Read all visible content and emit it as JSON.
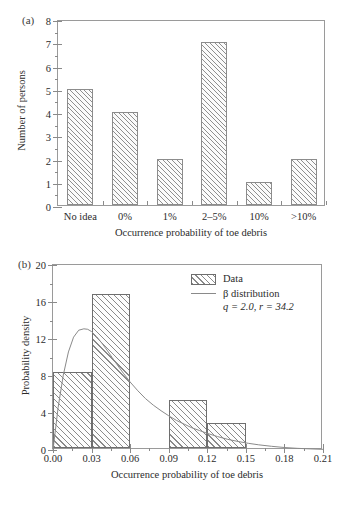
{
  "figure": {
    "panel_a_label": "(a)",
    "panel_b_label": "(b)"
  },
  "chart_data": [
    {
      "type": "bar",
      "panel": "(a)",
      "title": "",
      "xlabel": "Occurrence probability of toe debris",
      "ylabel": "Number of persons",
      "categories": [
        "No idea",
        "0%",
        "1%",
        "2–5%",
        "10%",
        ">10%"
      ],
      "values": [
        5,
        4,
        2,
        7,
        1,
        2
      ],
      "ylim": [
        0,
        8
      ],
      "yticks": [
        0,
        1,
        2,
        3,
        4,
        5,
        6,
        7,
        8
      ],
      "ytick_labels": [
        "0",
        "1",
        "2",
        "3",
        "4",
        "5",
        "6",
        "7",
        "8"
      ],
      "grid": false,
      "legend": null,
      "bar_fill": "hatched-45deg",
      "bar_edge_color": "#8c8c8c"
    },
    {
      "type": "area",
      "panel": "(b)",
      "title": "",
      "xlabel": "Occurrence probability of toe debris",
      "ylabel": "Probability density",
      "xlim": [
        0.0,
        0.21
      ],
      "ylim": [
        0,
        20
      ],
      "xticks": [
        0.0,
        0.03,
        0.06,
        0.09,
        0.12,
        0.15,
        0.18,
        0.21
      ],
      "xtick_labels": [
        "0.00",
        "0.03",
        "0.06",
        "0.09",
        "0.12",
        "0.15",
        "0.18",
        "0.21"
      ],
      "yticks": [
        0,
        4,
        8,
        12,
        16,
        20
      ],
      "ytick_labels": [
        "0",
        "4",
        "8",
        "12",
        "16",
        "20"
      ],
      "grid": false,
      "legend_position": "top-right",
      "legend_entries": [
        "Data",
        "β distribution"
      ],
      "legend_params": "q = 2.0, r = 34.2",
      "legend_param_q": "2.0",
      "legend_param_r": "34.2",
      "histogram": {
        "name": "Data",
        "bin_edges": [
          0.0,
          0.03,
          0.06,
          0.09,
          0.12,
          0.15
        ],
        "bin_values": [
          8.2,
          16.6,
          0.0,
          5.2,
          2.7
        ]
      },
      "curve": {
        "name": "β distribution",
        "q": 2.0,
        "r": 34.2,
        "x": [
          0.0,
          0.004,
          0.008,
          0.012,
          0.016,
          0.02,
          0.024,
          0.027,
          0.03,
          0.034,
          0.038,
          0.042,
          0.046,
          0.05,
          0.055,
          0.06,
          0.066,
          0.072,
          0.078,
          0.084,
          0.09,
          0.096,
          0.102,
          0.108,
          0.114,
          0.12,
          0.128,
          0.136,
          0.144,
          0.152,
          0.16,
          0.17,
          0.18,
          0.19,
          0.2,
          0.21
        ],
        "y": [
          0.0,
          4.6,
          8.1,
          10.6,
          12.2,
          12.95,
          13.1,
          13.05,
          12.8,
          12.25,
          11.55,
          10.8,
          10.0,
          9.2,
          8.25,
          7.35,
          6.4,
          5.55,
          4.85,
          4.25,
          3.7,
          3.2,
          2.8,
          2.4,
          2.1,
          1.8,
          1.45,
          1.15,
          0.92,
          0.72,
          0.56,
          0.4,
          0.27,
          0.18,
          0.12,
          0.07
        ]
      }
    }
  ]
}
